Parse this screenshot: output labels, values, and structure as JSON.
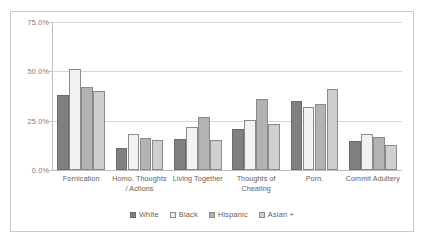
{
  "chart_data": {
    "type": "bar",
    "title": "",
    "subtitle": "",
    "xlabel": "",
    "ylabel": "",
    "ylim": [
      0,
      75
    ],
    "grid": true,
    "legend_position": "bottom",
    "y_ticks": [
      "0.0%",
      "25.0%",
      "50.0%",
      "75.0%"
    ],
    "y_tick_values": [
      0,
      25,
      50,
      75
    ],
    "categories": [
      "Fornication",
      "Homo. Thoughts / Actions",
      "Living Together",
      "Thoughts of Cheating",
      "Porn.",
      "Commit Adultery"
    ],
    "series": [
      {
        "name": "White",
        "color": "#808080",
        "values": [
          38.0,
          11.0,
          15.5,
          21.0,
          35.0,
          14.5
        ]
      },
      {
        "name": "Black",
        "color": "#f2f2f2",
        "values": [
          51.0,
          18.5,
          22.0,
          25.5,
          32.0,
          18.5
        ]
      },
      {
        "name": "Hispanic",
        "color": "#b3b3b3",
        "values": [
          42.0,
          16.0,
          27.0,
          36.0,
          33.5,
          16.5
        ]
      },
      {
        "name": "Asian +",
        "color": "#cfcfcf",
        "values": [
          40.0,
          15.0,
          15.0,
          23.5,
          41.0,
          12.5
        ]
      }
    ]
  },
  "colors": {
    "gridline": "#d6d6d6",
    "axis": "#bdbdbd",
    "frame": "#c9c9c9",
    "text": "#5e5e5e",
    "background": "#ffffff"
  }
}
